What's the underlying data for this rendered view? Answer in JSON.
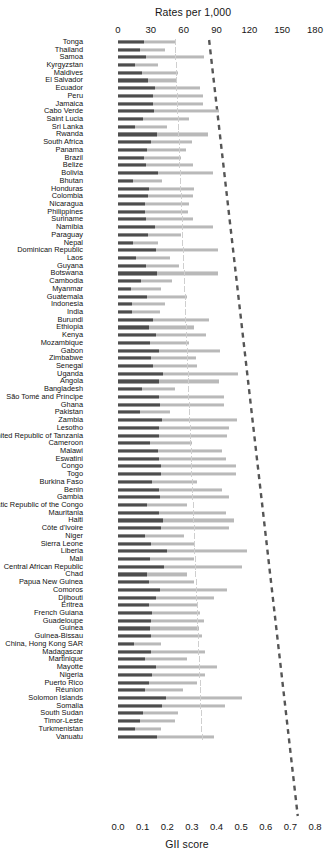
{
  "chart_data": {
    "type": "bar",
    "title": "",
    "top_axis": {
      "label": "Rates per 1,000",
      "ticks": [
        0,
        30,
        60,
        90,
        120,
        150,
        180
      ],
      "lim": [
        0,
        180
      ]
    },
    "bottom_axis": {
      "label": "GII score",
      "ticks": [
        "0.0",
        "0.1",
        "0.2",
        "0.3",
        "0.4",
        "0.5",
        "0.6",
        "0.7",
        "0.8"
      ],
      "lim": [
        0,
        0.8
      ]
    },
    "series": [
      {
        "name": "GII score",
        "color": "#4d4d4d",
        "axis": "bottom"
      },
      {
        "name": "Rates per 1,000",
        "color": "#b9b9b9",
        "axis": "top"
      }
    ],
    "trendline": {
      "style": "dashed",
      "color": "#555555",
      "x_start": 0.37,
      "x_end": 0.73
    },
    "grid": true,
    "legend": "none",
    "categories": [
      "Tonga",
      "Thailand",
      "Samoa",
      "Kyrgyzstan",
      "Maldives",
      "El Salvador",
      "Ecuador",
      "Peru",
      "Jamaica",
      "Cabo Verde",
      "Saint Lucia",
      "Sri Lanka",
      "Rwanda",
      "South Africa",
      "Panama",
      "Brazil",
      "Belize",
      "Bolivia",
      "Bhutan",
      "Honduras",
      "Colombia",
      "Nicaragua",
      "Philippines",
      "Suriname",
      "Namibia",
      "Paraguay",
      "Nepal",
      "Dominican Republic",
      "Laos",
      "Guyana",
      "Botswana",
      "Cambodia",
      "Myanmar",
      "Guatemala",
      "Indonesia",
      "India",
      "Burundi",
      "Ethiopia",
      "Kenya",
      "Mozambique",
      "Gabon",
      "Zimbabwe",
      "Senegal",
      "Uganda",
      "Angola",
      "Bangladesh",
      "São Tomé and Príncipe",
      "Ghana",
      "Pakistan",
      "Zambia",
      "Lesotho",
      "United Republic of Tanzania",
      "Cameroon",
      "Malawi",
      "Eswatini",
      "Congo",
      "Togo",
      "Burkina Faso",
      "Benin",
      "Gambia",
      "Democratic Republic of the Congo",
      "Mauritania",
      "Haiti",
      "Côte d'Ivoire",
      "Niger",
      "Sierra Leone",
      "Liberia",
      "Mali",
      "Central African Republic",
      "Chad",
      "Papua New Guinea",
      "Comoros",
      "Djibouti",
      "Eritrea",
      "French Guiana",
      "Guadeloupe",
      "Guinea",
      "Guinea-Bissau",
      "China, Hong Kong SAR",
      "Madagascar",
      "Martinique",
      "Mayotte",
      "Nigeria",
      "Puerto Rico",
      "Réunion",
      "Solomon Islands",
      "Somalia",
      "South Sudan",
      "Timor-Leste",
      "Turkmenistan",
      "Vanuatu"
    ],
    "gii_score": [
      0.35,
      0.33,
      0.37,
      0.36,
      0.37,
      0.37,
      0.38,
      0.38,
      0.38,
      0.38,
      0.36,
      0.39,
      0.4,
      0.41,
      0.39,
      0.39,
      0.4,
      0.41,
      0.42,
      0.43,
      0.43,
      0.43,
      0.42,
      0.43,
      0.44,
      0.44,
      0.45,
      0.45,
      0.46,
      0.46,
      0.47,
      0.46,
      0.48,
      0.48,
      0.48,
      0.49,
      0.5,
      0.5,
      0.51,
      0.51,
      0.52,
      0.52,
      0.52,
      0.53,
      0.53,
      0.53,
      0.54,
      0.54,
      0.54,
      0.55,
      0.55,
      0.56,
      0.56,
      0.56,
      0.57,
      0.57,
      0.57,
      0.58,
      0.58,
      0.58,
      0.59,
      0.59,
      0.6,
      0.6,
      0.6,
      0.61,
      0.61,
      0.61,
      0.62,
      0.62,
      0.62,
      0.63,
      0.63,
      0.63,
      0.64,
      0.64,
      0.64,
      0.65,
      0.65,
      0.65,
      0.66,
      0.66,
      0.66,
      0.67,
      0.67,
      0.68,
      0.69,
      0.7,
      0.71,
      0.72,
      0.73
    ],
    "rate_per_1000": [
      37,
      27,
      51,
      22,
      33,
      33,
      49,
      51,
      52,
      64,
      41,
      28,
      58,
      43,
      39,
      36,
      43,
      56,
      25,
      44,
      43,
      41,
      40,
      43,
      55,
      36,
      23,
      58,
      30,
      35,
      58,
      31,
      25,
      40,
      27,
      24,
      53,
      44,
      51,
      41,
      60,
      45,
      46,
      71,
      59,
      33,
      62,
      62,
      30,
      70,
      65,
      64,
      43,
      61,
      63,
      69,
      69,
      46,
      61,
      65,
      40,
      63,
      68,
      65,
      38,
      45,
      76,
      44,
      73,
      40,
      44,
      64,
      56,
      46,
      48,
      50,
      47,
      49,
      25,
      51,
      40,
      58,
      51,
      46,
      38,
      73,
      63,
      35,
      33,
      25,
      56
    ],
    "bar_pixels": {
      "dark_end": [
        26,
        22,
        28,
        17,
        24,
        30,
        37,
        35,
        35,
        36,
        25,
        17,
        39,
        33,
        29,
        26,
        28,
        40,
        15,
        31,
        30,
        27,
        27,
        28,
        37,
        30,
        15,
        38,
        18,
        28,
        39,
        23,
        13,
        29,
        14,
        14,
        35,
        31,
        38,
        32,
        41,
        33,
        35,
        45,
        41,
        24,
        41,
        42,
        22,
        44,
        41,
        41,
        32,
        40,
        41,
        43,
        43,
        34,
        41,
        42,
        29,
        41,
        45,
        43,
        27,
        33,
        49,
        32,
        46,
        29,
        31,
        42,
        38,
        31,
        34,
        33,
        32,
        33,
        16,
        33,
        27,
        38,
        34,
        31,
        27,
        48,
        44,
        25,
        22,
        17,
        39
      ],
      "light_end": [
        57,
        47,
        86,
        40,
        60,
        58,
        82,
        85,
        85,
        101,
        71,
        49,
        90,
        74,
        68,
        63,
        75,
        95,
        44,
        76,
        75,
        71,
        70,
        75,
        95,
        63,
        40,
        100,
        52,
        61,
        100,
        54,
        43,
        69,
        47,
        42,
        91,
        76,
        88,
        71,
        102,
        78,
        79,
        120,
        101,
        57,
        106,
        106,
        52,
        119,
        111,
        109,
        74,
        104,
        108,
        118,
        118,
        79,
        104,
        111,
        69,
        108,
        116,
        111,
        66,
        77,
        129,
        76,
        124,
        69,
        76,
        109,
        96,
        79,
        82,
        86,
        81,
        84,
        43,
        87,
        69,
        99,
        87,
        79,
        65,
        124,
        107,
        60,
        57,
        43,
        96
      ]
    }
  }
}
